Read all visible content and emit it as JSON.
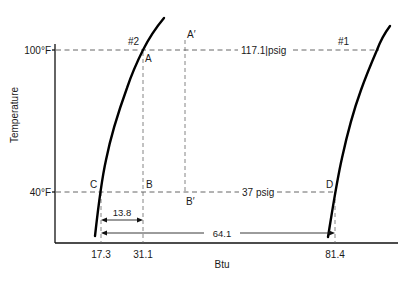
{
  "diagram": {
    "y_axis_label": "Temperature",
    "x_axis_label": "Btu",
    "y_ticks": [
      {
        "label": "100°F",
        "value": 100
      },
      {
        "label": "40°F",
        "value": 40
      }
    ],
    "x_ticks": [
      {
        "label": "17.3",
        "value": 17.3
      },
      {
        "label": "31.1",
        "value": 31.1
      },
      {
        "label": "81.4",
        "value": 81.4
      }
    ],
    "curves": [
      {
        "name": "#2",
        "label": "#2"
      },
      {
        "name": "#1",
        "label": "#1"
      }
    ],
    "points": {
      "A": "A",
      "A_prime": "A′",
      "B": "B",
      "B_prime": "B′",
      "C": "C",
      "D": "D"
    },
    "pressure_lines": {
      "high": "117.1|psig",
      "low": "37 psig"
    },
    "dimensions": {
      "c_to_b": "13.8",
      "c_to_d": "64.1"
    },
    "colors": {
      "line": "#000000",
      "dashed": "#555555",
      "background": "#ffffff"
    }
  }
}
